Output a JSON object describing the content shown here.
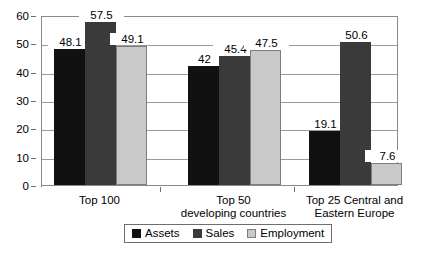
{
  "chart_data": {
    "type": "bar",
    "title": "",
    "subtitle": "",
    "xlabel": "",
    "ylabel": "",
    "ylim": [
      0,
      60
    ],
    "yticks": [
      0,
      10,
      20,
      30,
      40,
      50,
      60
    ],
    "ytick_labels": [
      "0",
      "10",
      "20",
      "30",
      "40",
      "50",
      "60"
    ],
    "grid": true,
    "legend_position": "bottom",
    "categories": [
      "Top 100",
      "Top 50\ndeveloping countries",
      "Top 25 Central and\nEastern Europe"
    ],
    "series": [
      {
        "name": "Assets",
        "color": "#111111",
        "values": [
          48.1,
          42,
          19.1
        ],
        "labels": [
          "48.1",
          "42",
          "19.1"
        ]
      },
      {
        "name": "Sales",
        "color": "#3a3a3a",
        "values": [
          57.5,
          45.4,
          50.6
        ],
        "labels": [
          "57.5",
          "45.4",
          "50.6"
        ]
      },
      {
        "name": "Employment",
        "color": "#c9c9c9",
        "values": [
          49.1,
          47.5,
          7.6
        ],
        "labels": [
          "49.1",
          "47.5",
          "7.6"
        ]
      }
    ]
  },
  "legend": {
    "items": [
      {
        "label": "Assets"
      },
      {
        "label": "Sales"
      },
      {
        "label": "Employment"
      }
    ]
  }
}
